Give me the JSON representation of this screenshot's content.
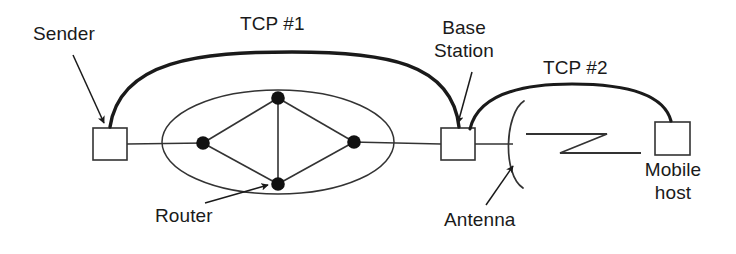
{
  "diagram": {
    "canvas": {
      "width": 736,
      "height": 254
    },
    "colors": {
      "ink": "#1a1a1a",
      "line": "#333333",
      "background": "#ffffff",
      "node_fill": "#111111"
    },
    "labels": {
      "sender": "Sender",
      "tcp1": "TCP #1",
      "base_station_line1": "Base",
      "base_station_line2": "Station",
      "tcp2": "TCP #2",
      "router": "Router",
      "antenna": "Antenna",
      "mobile_host_line1": "Mobile",
      "mobile_host_line2": "host"
    },
    "nodes": [
      {
        "id": "sender-host",
        "type": "box",
        "x": 93,
        "y": 128,
        "w": 34,
        "h": 32
      },
      {
        "id": "base-station",
        "type": "box",
        "x": 441,
        "y": 128,
        "w": 34,
        "h": 32
      },
      {
        "id": "mobile-host",
        "type": "box",
        "x": 655,
        "y": 122,
        "w": 35,
        "h": 33
      }
    ],
    "router_cloud": {
      "ellipse": {
        "cx": 278,
        "cy": 142,
        "rx": 116,
        "ry": 52
      },
      "nodes": [
        {
          "id": "router-left",
          "cx": 203,
          "cy": 143,
          "r": 6.5
        },
        {
          "id": "router-top",
          "cx": 278,
          "cy": 98,
          "r": 6.5
        },
        {
          "id": "router-right",
          "cx": 354,
          "cy": 142,
          "r": 6.5
        },
        {
          "id": "router-bottom",
          "cx": 278,
          "cy": 184,
          "r": 6.5
        }
      ],
      "edges": [
        [
          "router-left",
          "router-top"
        ],
        [
          "router-top",
          "router-right"
        ],
        [
          "router-right",
          "router-bottom"
        ],
        [
          "router-bottom",
          "router-left"
        ],
        [
          "router-top",
          "router-bottom"
        ]
      ]
    },
    "connections": [
      {
        "id": "tcp1-arc",
        "from": "sender-host",
        "to": "base-station",
        "label": "TCP #1",
        "style": "thick-arc"
      },
      {
        "id": "tcp2-arc",
        "from": "base-station",
        "to": "mobile-host",
        "label": "TCP #2",
        "style": "thick-arc"
      },
      {
        "id": "wire-sender-cloud",
        "from": "sender-host",
        "to": "router-left",
        "style": "line"
      },
      {
        "id": "wire-cloud-base",
        "from": "router-right",
        "to": "base-station",
        "style": "line"
      },
      {
        "id": "wire-base-antenna",
        "from": "base-station",
        "to": "antenna",
        "style": "line"
      },
      {
        "id": "wireless-link",
        "from": "antenna",
        "to": "mobile-host",
        "style": "lightning"
      }
    ],
    "annotations": [
      {
        "id": "sender-callout",
        "label": "Sender",
        "points_to": "sender-host"
      },
      {
        "id": "base-station-callout",
        "label": "Base Station",
        "points_to": "base-station"
      },
      {
        "id": "router-callout",
        "label": "Router",
        "points_to": "router-bottom"
      },
      {
        "id": "antenna-callout",
        "label": "Antenna",
        "points_to": "antenna"
      }
    ],
    "label_positions": {
      "sender": {
        "left": 33,
        "top": 22
      },
      "tcp1": {
        "left": 240,
        "top": 12
      },
      "base_station": {
        "left": 428,
        "top": 16
      },
      "tcp2": {
        "left": 543,
        "top": 56
      },
      "router": {
        "left": 155,
        "top": 204
      },
      "antenna": {
        "left": 444,
        "top": 208
      },
      "mobile_host": {
        "left": 633,
        "top": 158
      }
    }
  }
}
